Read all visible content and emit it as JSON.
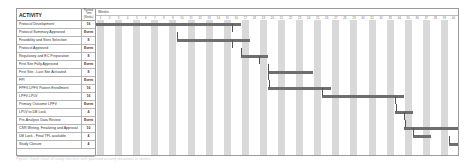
{
  "chart_data": {
    "type": "gantt",
    "title": "",
    "timeline_label": "Weeks",
    "xlabel": "Weeks",
    "columns": {
      "activity": "ACTIVITY",
      "duration": "Planned Time (Weeks)"
    },
    "weeks": [
      1,
      2,
      3,
      4,
      5,
      6,
      7,
      8,
      9,
      10,
      11,
      12,
      13,
      14,
      15,
      16,
      17,
      18,
      19,
      20,
      21,
      22,
      23,
      24,
      25,
      26,
      27,
      28,
      29,
      30,
      31,
      32,
      33,
      34,
      35,
      36,
      37,
      38,
      39,
      40
    ],
    "grid": "alternating shaded week columns",
    "activities": [
      {
        "name": "Protocol Development",
        "duration": "16",
        "start_week": 1,
        "end_week": 16
      },
      {
        "name": "Protocol Summary Approved",
        "duration": "Event",
        "start_week": 16,
        "end_week": 16
      },
      {
        "name": "Feasibility and Sites Selection",
        "duration": "8",
        "start_week": 10,
        "end_week": 17
      },
      {
        "name": "Protocol Approved",
        "duration": "Event",
        "start_week": 16,
        "end_week": 16
      },
      {
        "name": "Regulatory and EC Preparation",
        "duration": "8",
        "start_week": 17,
        "end_week": 19
      },
      {
        "name": "First Site Fully Approved",
        "duration": "Event",
        "start_week": 19,
        "end_week": 19
      },
      {
        "name": "First Site - Last Site Activated",
        "duration": "8",
        "start_week": 20,
        "end_week": 24
      },
      {
        "name": "FPI",
        "duration": "Event",
        "start_week": 20,
        "end_week": 20
      },
      {
        "name": "FPFV-LPFV Patient Enrollment",
        "duration": "16",
        "start_week": 20,
        "end_week": 26
      },
      {
        "name": "LPFV-LPLV",
        "duration": "16",
        "start_week": 26,
        "end_week": 34
      },
      {
        "name": "Primary Outcome LPFV",
        "duration": "Event",
        "start_week": 34,
        "end_week": 34
      },
      {
        "name": "LPLV to DB Lock",
        "duration": "4",
        "start_week": 34,
        "end_week": 35
      },
      {
        "name": "Pre-Analysis Data Review",
        "duration": "Event",
        "start_week": 35,
        "end_week": 35
      },
      {
        "name": "CSR Writing, Finalizing and Approval",
        "duration": "10",
        "start_week": 35,
        "end_week": 40
      },
      {
        "name": "DB Lock - Final TFL available",
        "duration": "4",
        "start_week": 36,
        "end_week": 37
      },
      {
        "name": "Study Closure",
        "duration": "4",
        "start_week": 40,
        "end_week": 42
      }
    ]
  },
  "table": {
    "header_activity": "ACTIVITY",
    "header_duration_lines": [
      "Planned",
      "Time",
      "(Weeks)"
    ]
  },
  "caption": "Figure: Gantt chart of study timeline with planned activity durations in weeks"
}
